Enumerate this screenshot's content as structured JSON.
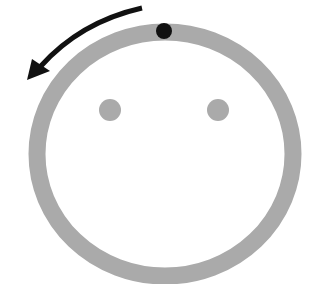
{
  "diagram": {
    "colors": {
      "background": "#ffffff",
      "ring": "#aaaaaa",
      "eyes": "#aaaaaa",
      "marker": "#111111",
      "arrow": "#111111"
    },
    "ring": {
      "cx": 165,
      "cy": 154,
      "rx": 128,
      "ry": 122,
      "stroke_width": 17
    },
    "eyes": [
      {
        "name": "left-eye",
        "cx": 110,
        "cy": 110,
        "r": 11
      },
      {
        "name": "right-eye",
        "cx": 218,
        "cy": 110,
        "r": 11
      }
    ],
    "marker": {
      "cx": 164,
      "cy": 31,
      "r": 8
    },
    "arrow": {
      "direction": "counter-clockwise",
      "path": "M142 8 Q 80 22 40 67",
      "stroke_width": 5,
      "head": "27,80 32,59 50,71"
    }
  }
}
